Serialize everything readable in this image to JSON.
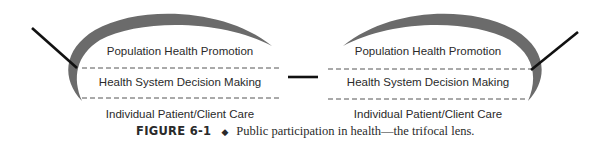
{
  "diagram": {
    "left_lens": {
      "levels": [
        "Population Health Promotion",
        "Health System Decision Making",
        "Individual Patient/Client Care"
      ]
    },
    "right_lens": {
      "levels": [
        "Population Health Promotion",
        "Health System Decision Making",
        "Individual Patient/Client Care"
      ]
    },
    "colors": {
      "lens_rim": "#6b6b6b",
      "line": "#111111",
      "dash": "#555555",
      "text": "#2a2a2a"
    }
  },
  "caption": {
    "figure_label": "FIGURE 6-1",
    "separator": "◆",
    "text": "Public participation in health—the trifocal lens."
  }
}
